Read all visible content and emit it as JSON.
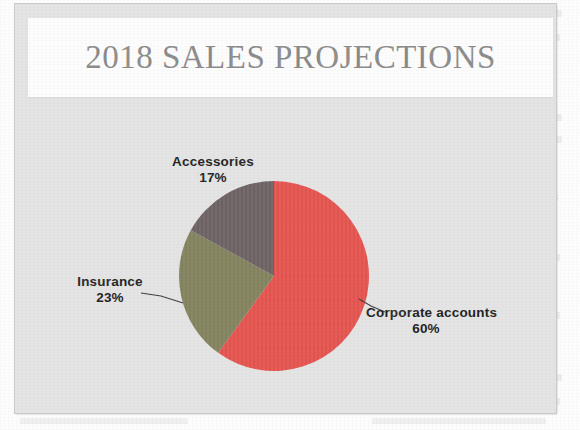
{
  "page": {
    "medium": "scanned-book-page",
    "background_color": "#fdfdfd"
  },
  "slide": {
    "background_color": "#e4e4e4",
    "title": "2018 SALES PROJECTIONS",
    "title_color": "#8a8a8a",
    "title_banner_color": "#fdfdfd"
  },
  "chart_data": {
    "type": "pie",
    "title": "2018 SALES PROJECTIONS",
    "xlabel": "",
    "ylabel": "",
    "legend": "none",
    "labels_inline": true,
    "start_angle_deg": 0,
    "direction": "clockwise",
    "categories": [
      "Corporate accounts",
      "Insurance",
      "Accessories"
    ],
    "values": [
      60,
      23,
      17
    ],
    "value_unit": "percent",
    "colors": [
      "#e4544f",
      "#83835f",
      "#6e6364"
    ],
    "slices": [
      {
        "name": "Corporate accounts",
        "label": "Corporate accounts",
        "value": 60,
        "value_label": "60%",
        "color": "#e4544f",
        "start_deg": 0,
        "end_deg": 216,
        "leader_line": true
      },
      {
        "name": "Insurance",
        "label": "Insurance",
        "value": 23,
        "value_label": "23%",
        "color": "#83835f",
        "start_deg": 216,
        "end_deg": 298.8,
        "leader_line": true
      },
      {
        "name": "Accessories",
        "label": "Accessories",
        "value": 17,
        "value_label": "17%",
        "color": "#6e6364",
        "start_deg": 298.8,
        "end_deg": 360,
        "leader_line": false
      }
    ],
    "label_text_color": "#222222"
  }
}
